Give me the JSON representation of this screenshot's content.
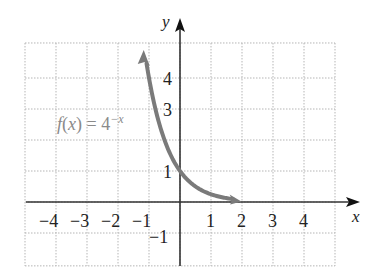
{
  "chart_data": {
    "type": "line",
    "title": "",
    "function_label": "f(x) = 4",
    "function_exponent": "−x",
    "xlabel": "x",
    "ylabel": "y",
    "xlim": [
      -5,
      5
    ],
    "ylim": [
      -2,
      5
    ],
    "grid": true,
    "x_ticks": [
      "−4",
      "−3",
      "−2",
      "−1",
      "1",
      "2",
      "3",
      "4"
    ],
    "y_ticks": [
      "4",
      "3",
      "1",
      "−1"
    ],
    "series": [
      {
        "name": "f(x) = 4^(−x)",
        "color": "#7a7a7a",
        "x": [
          -1.2,
          -1.0,
          -0.75,
          -0.5,
          -0.25,
          0,
          0.25,
          0.5,
          0.75,
          1.0,
          1.25,
          1.5,
          1.8
        ],
        "y": [
          5.28,
          4.0,
          2.83,
          2.0,
          1.41,
          1.0,
          0.71,
          0.5,
          0.35,
          0.25,
          0.18,
          0.125,
          0.08
        ]
      }
    ]
  },
  "colors": {
    "axis": "#333333",
    "grid": "#b5b5b5",
    "curve": "#7a7a7a",
    "label": "#8a8a8a"
  }
}
